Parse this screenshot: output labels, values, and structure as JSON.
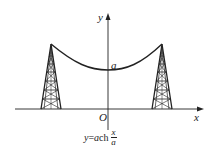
{
  "diagram": {
    "axes": {
      "x_label": "x",
      "y_label": "y",
      "origin_label": "O"
    },
    "curve": {
      "type": "catenary",
      "vertex_label": "a"
    },
    "formula": {
      "lhs": "y",
      "eq": "=",
      "coef": "a",
      "func": "ch",
      "frac_num": "x",
      "frac_den": "a"
    },
    "colors": {
      "stroke": "#222222",
      "background": "#ffffff"
    }
  }
}
